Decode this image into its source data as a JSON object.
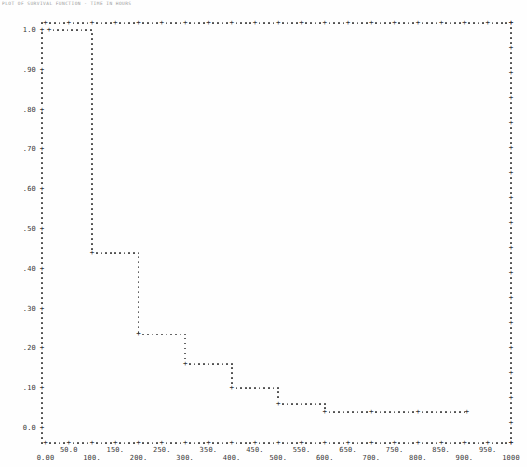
{
  "page": {
    "kind": "line-printer scan of a step plot",
    "caption_note": "tiny faint caption at top-left (illegible in source)"
  },
  "colors": {
    "ink": "#3d3d3d",
    "ink_faint": "#9a9a9a",
    "paper": "#fefefe"
  },
  "chart_data": {
    "type": "line",
    "subtype": "step-survival-function",
    "title": "PLOT OF SURVIVAL FUNCTION - TIME IN HOURS",
    "xlabel": "",
    "ylabel": "",
    "xlim": [
      0,
      1000
    ],
    "ylim": [
      0.0,
      1.0
    ],
    "x_tick_interval": 50,
    "y_tick_interval": 0.1,
    "grid": false,
    "legend": null,
    "frame": "dotted border with plus tick marks on all four sides",
    "y_tick_labels": [
      "1.0",
      ".90",
      ".80",
      ".70",
      ".60",
      ".50",
      ".40",
      ".30",
      ".20",
      ".10",
      "0.0"
    ],
    "x_tick_labels_upper": [
      "50.0",
      "150.",
      "250.",
      "350.",
      "450.",
      "550.",
      "650.",
      "750.",
      "850.",
      "950."
    ],
    "x_tick_labels_lower": [
      "0.00",
      "100.",
      "200.",
      "300.",
      "400.",
      "500.",
      "600.",
      "700.",
      "800.",
      "900.",
      "1000"
    ],
    "steps": [
      {
        "x_start": 0,
        "x_end": 100,
        "y": 1.0
      },
      {
        "x_start": 100,
        "x_end": 200,
        "y": 0.44
      },
      {
        "x_start": 200,
        "x_end": 300,
        "y": 0.235
      },
      {
        "x_start": 300,
        "x_end": 400,
        "y": 0.16
      },
      {
        "x_start": 400,
        "x_end": 500,
        "y": 0.1
      },
      {
        "x_start": 500,
        "x_end": 600,
        "y": 0.06
      },
      {
        "x_start": 600,
        "x_end": 905,
        "y": 0.04
      }
    ],
    "plus_markers": [
      {
        "x": 0,
        "y": 1.0
      },
      {
        "x": 100,
        "y": 0.44
      },
      {
        "x": 200,
        "y": 0.235
      },
      {
        "x": 300,
        "y": 0.16
      },
      {
        "x": 400,
        "y": 0.1
      },
      {
        "x": 500,
        "y": 0.06
      },
      {
        "x": 600,
        "y": 0.04
      },
      {
        "x": 700,
        "y": 0.04
      },
      {
        "x": 800,
        "y": 0.04
      },
      {
        "x": 905,
        "y": 0.04
      }
    ]
  }
}
